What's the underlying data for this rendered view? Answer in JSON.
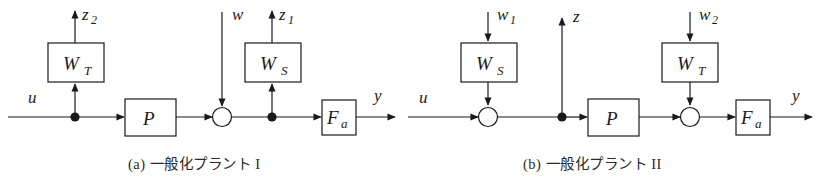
{
  "figure": {
    "type": "block-diagram",
    "background_color": "#ffffff",
    "line_color": "#1a1a1a",
    "panels": [
      {
        "id": "a",
        "caption": "(a) 一般化プラント I",
        "blocks": [
          {
            "name": "W_T",
            "base": "W",
            "sub": "T"
          },
          {
            "name": "P",
            "base": "P",
            "sub": ""
          },
          {
            "name": "W_S",
            "base": "W",
            "sub": "S"
          },
          {
            "name": "F_a",
            "base": "F",
            "sub": "a"
          }
        ],
        "signals": [
          {
            "name": "u",
            "base": "u",
            "sub": ""
          },
          {
            "name": "z_2",
            "base": "z",
            "sub": "2"
          },
          {
            "name": "w",
            "base": "w",
            "sub": ""
          },
          {
            "name": "z_1",
            "base": "z",
            "sub": "1"
          },
          {
            "name": "y",
            "base": "y",
            "sub": ""
          }
        ],
        "summing_junctions": 1,
        "branch_nodes": 2
      },
      {
        "id": "b",
        "caption": "(b) 一般化プラント II",
        "blocks": [
          {
            "name": "W_S",
            "base": "W",
            "sub": "S"
          },
          {
            "name": "P",
            "base": "P",
            "sub": ""
          },
          {
            "name": "W_T",
            "base": "W",
            "sub": "T"
          },
          {
            "name": "F_a",
            "base": "F",
            "sub": "a"
          }
        ],
        "signals": [
          {
            "name": "u",
            "base": "u",
            "sub": ""
          },
          {
            "name": "w_1",
            "base": "w",
            "sub": "1"
          },
          {
            "name": "z",
            "base": "z",
            "sub": ""
          },
          {
            "name": "w_2",
            "base": "w",
            "sub": "2"
          },
          {
            "name": "y",
            "base": "y",
            "sub": ""
          }
        ],
        "summing_junctions": 2,
        "branch_nodes": 1
      }
    ]
  }
}
